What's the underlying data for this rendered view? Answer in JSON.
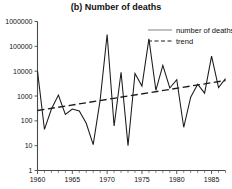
{
  "chart_data": {
    "type": "line",
    "title": "(b) Number of deaths",
    "xlabel": "",
    "ylabel": "",
    "yscale": "log",
    "ylim": [
      1,
      1000000
    ],
    "xlim": [
      1960,
      1987
    ],
    "grid": false,
    "legend_position": "top-right",
    "y_ticks": [
      1,
      10,
      100,
      1000,
      10000,
      100000,
      1000000
    ],
    "y_tick_labels": [
      "1",
      "10",
      "100",
      "1000",
      "10000",
      "100000",
      "1000000"
    ],
    "x_ticks": [
      1960,
      1965,
      1970,
      1975,
      1980,
      1985
    ],
    "x_tick_labels": [
      "1960",
      "1965",
      "1970",
      "1975",
      "1980",
      "1985"
    ],
    "x_minor_tick_interval": 1,
    "series": [
      {
        "name": "number of deaths",
        "style": "solid",
        "color": "#1a1a1a",
        "x": [
          1960,
          1961,
          1962,
          1963,
          1964,
          1965,
          1966,
          1967,
          1968,
          1969,
          1970,
          1971,
          1972,
          1973,
          1974,
          1975,
          1976,
          1977,
          1978,
          1979,
          1980,
          1981,
          1982,
          1983,
          1984,
          1985,
          1986,
          1987
        ],
        "values": [
          10000,
          45,
          300,
          1100,
          180,
          300,
          250,
          80,
          11,
          700,
          300000,
          62,
          9000,
          10,
          8000,
          2500,
          200000,
          1700,
          17000,
          2100,
          4500,
          55,
          900,
          3000,
          1300,
          40000,
          2200,
          5000
        ]
      },
      {
        "name": "trend",
        "style": "dashed",
        "color": "#1a1a1a",
        "x": [
          1960,
          1987
        ],
        "values": [
          260,
          4200
        ]
      }
    ],
    "legend_entries": [
      {
        "label": "number of deaths",
        "style": "solid"
      },
      {
        "label": "trend",
        "style": "dashed"
      }
    ]
  }
}
